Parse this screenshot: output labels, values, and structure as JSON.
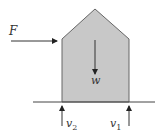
{
  "diagram": {
    "type": "free-body diagram",
    "body": {
      "shape": "house-pentagon",
      "fill": "#c8c8c8",
      "stroke": "#555555",
      "points": [
        [
          62,
          102
        ],
        [
          62,
          39
        ],
        [
          95,
          9
        ],
        [
          129,
          39
        ],
        [
          129,
          102
        ]
      ]
    },
    "ground_line": {
      "x1": 33,
      "x2": 155,
      "y": 102,
      "color": "#444444"
    },
    "forces": {
      "applied": {
        "label": "F",
        "direction": "right",
        "x1": 11,
        "y1": 41,
        "x2": 57,
        "y2": 41
      },
      "weight": {
        "label": "w",
        "direction": "down",
        "x1": 95,
        "y1": 40,
        "x2": 95,
        "y2": 74
      },
      "reaction_left": {
        "label": "v",
        "subscript": "2",
        "direction": "up",
        "x1": 62,
        "y1": 126,
        "x2": 62,
        "y2": 106
      },
      "reaction_right": {
        "label": "v",
        "subscript": "1",
        "direction": "up",
        "x1": 129,
        "y1": 126,
        "x2": 129,
        "y2": 106
      }
    }
  }
}
